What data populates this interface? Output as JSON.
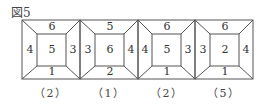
{
  "figure": {
    "title": "図5",
    "panels": [
      {
        "top": "6",
        "left": "4",
        "center": "5",
        "right": "3",
        "bottom": "1",
        "caption": "（2）"
      },
      {
        "top": "5",
        "left": "3",
        "center": "6",
        "right": "4",
        "bottom": "2",
        "caption": "（1）"
      },
      {
        "top": "6",
        "left": "4",
        "center": "5",
        "right": "3",
        "bottom": "1",
        "caption": "（2）"
      },
      {
        "top": "6",
        "left": "3",
        "center": "2",
        "right": "4",
        "bottom": "1",
        "caption": "（5）"
      }
    ]
  }
}
